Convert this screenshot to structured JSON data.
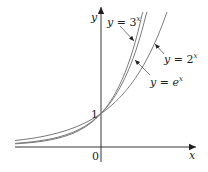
{
  "chart_data": {
    "type": "line",
    "title": "",
    "xlabel": "x",
    "ylabel": "y",
    "origin_label": "0",
    "y_tick_labels": [
      "1"
    ],
    "xlim": [
      -2.7,
      2.9
    ],
    "ylim": [
      -0.6,
      4.6
    ],
    "grid": false,
    "legend": "inline annotations with pointer arrows",
    "series": [
      {
        "name": "y = 3^x",
        "label_text": "y = 3",
        "label_exp": "x",
        "base": 3
      },
      {
        "name": "y = e^x",
        "label_text": "y = e",
        "label_exp": "x",
        "base": 2.718281828
      },
      {
        "name": "y = 2^x",
        "label_text": "y = 2",
        "label_exp": "x",
        "base": 2
      }
    ],
    "annotations": [
      {
        "text": "y = 3^x",
        "points_to": "y = 3^x"
      },
      {
        "text": "y = e^x",
        "points_to": "y = e^x"
      },
      {
        "text": "y = 2^x",
        "points_to": "y = 2^x"
      },
      {
        "text": "1",
        "at": [
          0,
          1
        ]
      }
    ],
    "colors": {
      "curve": "#7a7a7a",
      "axis": "#231f20",
      "text": "#231f20"
    }
  }
}
